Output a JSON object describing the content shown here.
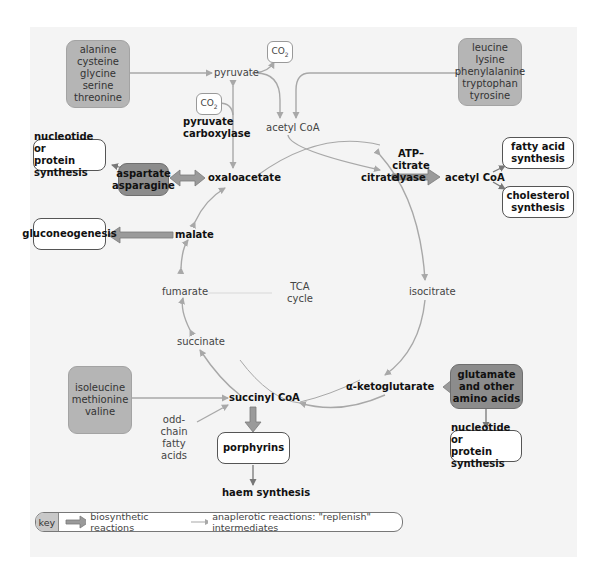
{
  "colors": {
    "background_panel": "#f4f4f4",
    "amino_box": "#b5b5b5",
    "amino_box_dark": "#8c8c8c",
    "arrow_light": "#a8a8a8",
    "arrow_thick": "#909090",
    "output_border": "#555555"
  },
  "cycle": {
    "center_label_line1": "TCA",
    "center_label_line2": "cycle",
    "intermediates": {
      "oxaloacetate": "oxaloacetate",
      "citrate": "citrate",
      "isocitrate": "isocitrate",
      "alpha_ketoglutarate": "α-ketoglutarate",
      "succinyl_coa": "succinyl CoA",
      "succinate": "succinate",
      "fumarate": "fumarate",
      "malate": "malate"
    }
  },
  "inputs": {
    "pyruvate": "pyruvate",
    "acetyl_coa_top": "acetyl CoA",
    "co2_top": "CO",
    "co2_left": "CO",
    "co2_subscript": "2",
    "pyruvate_carboxylase_line1": "pyruvate",
    "pyruvate_carboxylase_line2": "carboxylase",
    "odd_chain_line1": "odd-chain",
    "odd_chain_line2": "fatty acids"
  },
  "amino_acid_groups": {
    "glucogenic_pyruvate": [
      "alanine",
      "cysteine",
      "glycine",
      "serine",
      "threonine"
    ],
    "ketogenic_acetyl": [
      "leucine",
      "lysine",
      "phenylalanine",
      "tryptophan",
      "tyrosine"
    ],
    "succinyl": [
      "isoleucine",
      "methionine",
      "valine"
    ],
    "aspartate": [
      "aspartate",
      "asparagine"
    ],
    "glutamate": [
      "glutamate",
      "and other",
      "amino acids"
    ]
  },
  "outputs": {
    "nucleotide_left": [
      "nucleotide or",
      "protein synthesis"
    ],
    "nucleotide_right": [
      "nucleotide or",
      "protein synthesis"
    ],
    "gluconeogenesis": "gluconeogenesis",
    "fatty_acid": [
      "fatty acid",
      "synthesis"
    ],
    "cholesterol": [
      "cholesterol",
      "synthesis"
    ],
    "porphyrins": "porphyrins",
    "haem": "haem synthesis",
    "acetyl_coa_right": "acetyl CoA",
    "atp_citrate_lyase_line1": "ATP–citrate",
    "atp_citrate_lyase_line2": "lyase"
  },
  "key": {
    "label": "key",
    "biosynthetic": "biosynthetic reactions",
    "anaplerotic": "anaplerotic reactions: \"replenish\" intermediates"
  }
}
